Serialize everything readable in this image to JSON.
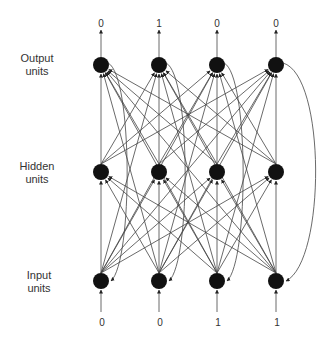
{
  "layers": {
    "output": {
      "label_line1": "Output",
      "label_line2": "units",
      "y": 65,
      "values": [
        "0",
        "1",
        "0",
        "0"
      ]
    },
    "hidden": {
      "label_line1": "Hidden",
      "label_line2": "units",
      "y": 172
    },
    "input": {
      "label_line1": "Input",
      "label_line2": "units",
      "y": 281,
      "values": [
        "0",
        "0",
        "1",
        "1"
      ]
    }
  },
  "node_x": [
    101,
    159,
    217,
    276
  ],
  "colors": {
    "node": "#111111",
    "edge": "#444444",
    "text": "#333333"
  }
}
